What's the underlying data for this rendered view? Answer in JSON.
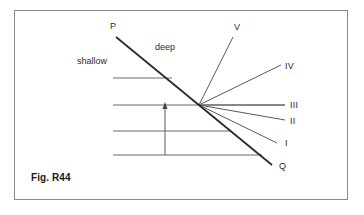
{
  "figure": {
    "caption": "Fig. R44",
    "frame": {
      "x": 14,
      "y": 10,
      "width": 334,
      "height": 190,
      "border_color": "#8a8a8a"
    },
    "background_color": "#ffffff",
    "ink_color": "#3a3a3a",
    "main_line_color": "#2a2a2a"
  },
  "labels": {
    "p": "P",
    "q": "Q",
    "v": "V",
    "iv": "IV",
    "iii": "III",
    "ii": "II",
    "i": "I",
    "deep": "deep",
    "shallow": "shallow"
  },
  "chart_data": {
    "type": "diagram",
    "title": "Fig. R44",
    "convergence_point": {
      "x": 199,
      "y": 105
    },
    "boundary_line": {
      "name": "PQ",
      "from_label": "P",
      "to_label": "Q",
      "from": {
        "x": 116,
        "y": 37
      },
      "to": {
        "x": 272,
        "y": 165
      },
      "stroke_width": 1.8,
      "color": "#2a2a2a"
    },
    "regions": [
      {
        "label": "shallow",
        "x": 77,
        "y": 62
      },
      {
        "label": "deep",
        "x": 155,
        "y": 48
      }
    ],
    "horizontal_lines": [
      {
        "index": 1,
        "y": 78,
        "x1": 113,
        "x2": 172
      },
      {
        "index": 2,
        "y": 105,
        "x1": 113,
        "x2": 285
      },
      {
        "index": 3,
        "y": 131,
        "x1": 113,
        "x2": 230
      },
      {
        "index": 4,
        "y": 155,
        "x1": 113,
        "x2": 262
      }
    ],
    "rays": [
      {
        "label": "V",
        "end": {
          "x": 233,
          "y": 37
        },
        "label_pos": {
          "x": 234,
          "y": 23
        }
      },
      {
        "label": "IV",
        "end": {
          "x": 281,
          "y": 65
        },
        "label_pos": {
          "x": 285,
          "y": 62
        }
      },
      {
        "label": "III",
        "end": {
          "x": 285,
          "y": 105
        },
        "label_pos": {
          "x": 290,
          "y": 101
        }
      },
      {
        "label": "II",
        "end": {
          "x": 285,
          "y": 120
        },
        "label_pos": {
          "x": 290,
          "y": 117
        }
      },
      {
        "label": "I",
        "end": {
          "x": 277,
          "y": 143
        },
        "label_pos": {
          "x": 285,
          "y": 139
        }
      }
    ],
    "arrow": {
      "name": "upward-arrow",
      "from": {
        "x": 165,
        "y": 155
      },
      "to": {
        "x": 165,
        "y": 104
      },
      "direction": "up"
    }
  }
}
